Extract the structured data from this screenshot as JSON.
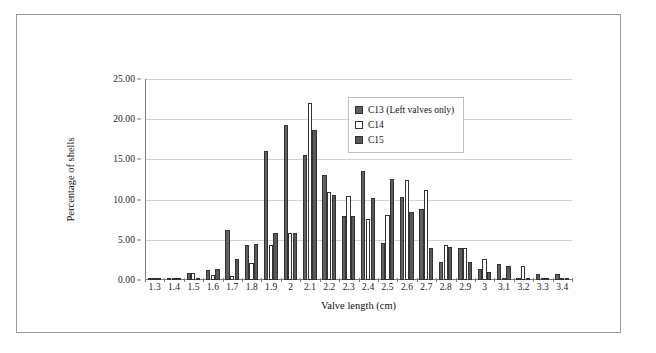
{
  "figure": {
    "border_color": "#9a9a9a",
    "background": "#ffffff"
  },
  "chart_data": {
    "type": "bar",
    "title": "",
    "xlabel": "Valve length (cm)",
    "ylabel": "Percentage of shells",
    "ylim": [
      0,
      25
    ],
    "ytick_labels": [
      "0.00",
      "5.00",
      "10.00",
      "15.00",
      "20.00",
      "25.00"
    ],
    "ytick_values": [
      0,
      5,
      10,
      15,
      20,
      25
    ],
    "grid": true,
    "grid_axis": "y",
    "legend_position": "upper right inside",
    "categories": [
      "1.3",
      "1.4",
      "1.5",
      "1.6",
      "1.7",
      "1.8",
      "1.9",
      "2",
      "2.1",
      "2.2",
      "2.3",
      "2.4",
      "2.5",
      "2.6",
      "2.7",
      "2.8",
      "2.9",
      "3",
      "3.1",
      "3.2",
      "3.3",
      "3.4"
    ],
    "series": [
      {
        "name": "C13 (Left valves only)",
        "color": "#606060",
        "values": [
          0.3,
          0.3,
          0.9,
          1.2,
          6.2,
          4.4,
          16.0,
          19.3,
          15.6,
          13.0,
          8.0,
          13.6,
          4.6,
          10.3,
          8.8,
          2.3,
          4.0,
          1.4,
          2.0,
          0.2,
          0.7,
          0.7
        ]
      },
      {
        "name": "C14",
        "color": "#ffffff",
        "values": [
          0.0,
          0.0,
          0.9,
          0.6,
          0.5,
          2.1,
          4.3,
          5.9,
          22.0,
          11.0,
          10.5,
          7.6,
          8.1,
          12.5,
          11.2,
          4.3,
          4.0,
          2.6,
          0.3,
          1.8,
          0.0,
          0.0
        ]
      },
      {
        "name": "C15",
        "color": "#595959",
        "values": [
          0.0,
          0.0,
          0.3,
          1.4,
          2.6,
          4.5,
          5.9,
          5.9,
          18.6,
          10.6,
          7.9,
          10.2,
          12.6,
          8.4,
          4.0,
          4.1,
          2.3,
          1.0,
          1.8,
          0.2,
          0.0,
          0.0
        ]
      }
    ]
  },
  "legend": {
    "items": [
      {
        "label": "C13 (Left valves only)"
      },
      {
        "label": "C14"
      },
      {
        "label": "C15"
      }
    ]
  }
}
